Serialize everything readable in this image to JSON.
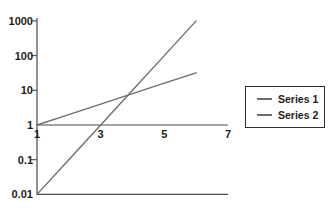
{
  "chart_data": {
    "type": "line",
    "title": "",
    "x": [
      1,
      2,
      3,
      4,
      5,
      6
    ],
    "series": [
      {
        "name": "Series 1",
        "values": [
          0.01,
          0.1,
          1,
          10,
          100,
          1000
        ],
        "color": "#6e6e6e"
      },
      {
        "name": "Series 2",
        "values": [
          1,
          2,
          4,
          8,
          16,
          32
        ],
        "color": "#6e6e6e"
      }
    ],
    "x_axis": {
      "scale": "linear",
      "range": [
        1,
        7
      ],
      "ticks": [
        1,
        3,
        5,
        7
      ],
      "tick_labels": [
        "1",
        "3",
        "5",
        "7"
      ],
      "axis_at_y_value": 1
    },
    "y_axis": {
      "scale": "log",
      "range": [
        0.01,
        1000
      ],
      "ticks": [
        1000,
        100,
        10,
        1,
        0.1,
        0.01
      ],
      "tick_labels": [
        "1000",
        "100",
        "10",
        "1",
        "0.1",
        "0.01"
      ],
      "bottom_border_at": 0.01
    },
    "grid": "off",
    "legend": {
      "position": "right",
      "bordered": true
    }
  },
  "colors": {
    "background": "#ffffff",
    "axis": "#4a4a4a",
    "line": "#6e6e6e",
    "text": "#1c1c1c",
    "legend_border": "#2e2e2e"
  }
}
